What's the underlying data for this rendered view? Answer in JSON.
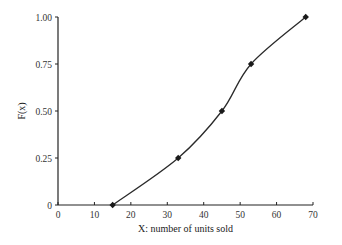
{
  "chart_data": {
    "type": "line",
    "title": "",
    "xlabel": "X: number of units sold",
    "ylabel": "F(x)",
    "xlim": [
      0,
      70
    ],
    "ylim": [
      0,
      1.0
    ],
    "x_ticks": [
      0,
      10,
      20,
      30,
      40,
      50,
      60,
      70
    ],
    "x_tick_labels": [
      "0",
      "10",
      "20",
      "30",
      "40",
      "50",
      "60",
      "70"
    ],
    "y_ticks": [
      0,
      0.25,
      0.5,
      0.75,
      1.0
    ],
    "y_tick_labels": [
      "0",
      "0.25",
      "0.50",
      "0.75",
      "1.00"
    ],
    "grid": false,
    "legend": null,
    "series": [
      {
        "name": "F(x)",
        "marker": "diamond",
        "color": "#222222",
        "smooth": true,
        "x": [
          15,
          33,
          45,
          53,
          68
        ],
        "y": [
          0,
          0.25,
          0.5,
          0.75,
          1.0
        ]
      }
    ]
  }
}
